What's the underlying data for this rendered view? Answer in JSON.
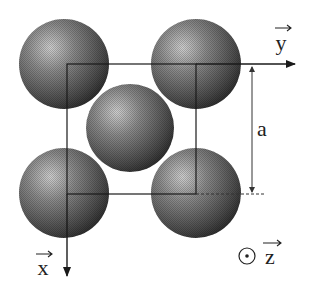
{
  "diagram": {
    "labels": {
      "y_axis": "y",
      "x_axis": "x",
      "z_axis": "z",
      "lattice_param": "a"
    },
    "atoms": [
      {
        "name": "top-left",
        "cx": 64,
        "cy": 64,
        "r": 45
      },
      {
        "name": "top-right",
        "cx": 196,
        "cy": 64,
        "r": 45
      },
      {
        "name": "center",
        "cx": 130,
        "cy": 128,
        "r": 44
      },
      {
        "name": "bottom-left",
        "cx": 64,
        "cy": 193,
        "r": 45
      },
      {
        "name": "bottom-right",
        "cx": 196,
        "cy": 193,
        "r": 45
      }
    ],
    "colors": {
      "atom_dark": "#2e2e2e",
      "atom_mid": "#6a6a6a",
      "atom_light": "#c8c8c8",
      "line": "#1a1a1a"
    }
  }
}
